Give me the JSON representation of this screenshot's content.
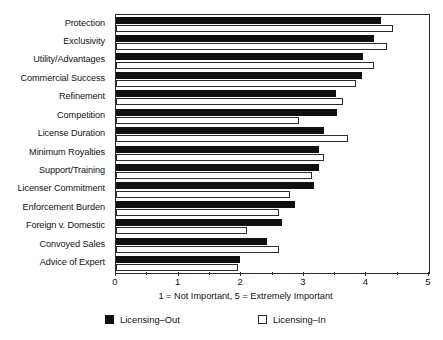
{
  "chart_data": {
    "type": "bar",
    "orientation": "horizontal",
    "title": "",
    "xlabel": "1 = Not Important, 5 = Extremely Important",
    "ylabel": "",
    "xlim": [
      0,
      5
    ],
    "xticks": [
      "0",
      "1",
      "2",
      "3",
      "4",
      "5"
    ],
    "grid": false,
    "legend_position": "bottom",
    "categories": [
      "Protection",
      "Exclusivity",
      "Utility/Advantages",
      "Commercial Success",
      "Refinement",
      "Competition",
      "License Duration",
      "Minimum Royalties",
      "Support/Training",
      "Licenser Commitment",
      "Enforcement Burden",
      "Foreign v. Domestic",
      "Convoyed Sales",
      "Advice of Expert"
    ],
    "series": [
      {
        "name": "Licensing–Out",
        "color": "#101010",
        "values": [
          4.23,
          4.12,
          3.94,
          3.93,
          3.51,
          3.53,
          3.32,
          3.24,
          3.24,
          3.16,
          2.86,
          2.65,
          2.42,
          1.98
        ]
      },
      {
        "name": "Licensing–In",
        "color": "#ffffff",
        "values": [
          4.42,
          4.33,
          4.12,
          3.83,
          3.63,
          2.92,
          3.71,
          3.32,
          3.13,
          2.78,
          2.6,
          2.09,
          2.6,
          1.95
        ]
      }
    ]
  },
  "legend": {
    "items": [
      {
        "label": "Licensing–Out",
        "swatch": "filled-black-square"
      },
      {
        "label": "Licensing–In",
        "swatch": "open-white-square"
      }
    ]
  }
}
